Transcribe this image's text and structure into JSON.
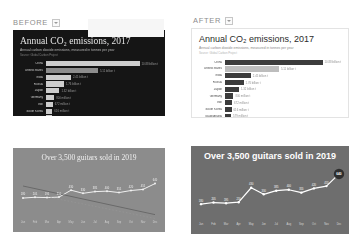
{
  "columns": {
    "before": {
      "label": "BEFORE",
      "caret": "chevron-down-icon"
    },
    "after": {
      "label": "AFTER",
      "caret": "chevron-down-icon"
    }
  },
  "co2_chart": {
    "title": "Annual CO₂ emissions, 2017",
    "subtitle": "Annual carbon dioxide emissions, measured in tonnes per year",
    "source": "Source: Global Carbon Project",
    "chart_data": {
      "type": "bar",
      "title": "Annual CO₂ emissions, 2017",
      "xlabel": "",
      "ylabel": "",
      "orientation": "horizontal",
      "categories": [
        "China",
        "United States",
        "India",
        "Russia",
        "Japan",
        "Germany",
        "Iran",
        "South Korea",
        "Saudi Arabia",
        "Indonesia"
      ],
      "values": [
        10.88,
        5.11,
        2.45,
        1.76,
        1.32,
        0.8,
        0.67,
        0.62,
        0.58,
        0.54
      ],
      "value_labels": [
        "10.88 billion t",
        "5.11 billion t",
        "2.45 billion t",
        "1.76 billion t",
        "1.32 billion t",
        "800 million t",
        "672 million t",
        "616 million t",
        "579 million t",
        "543 million t"
      ],
      "unit": "billion tonnes",
      "xlim": [
        0,
        11
      ],
      "grid": false,
      "legend": "none"
    }
  },
  "guitar_chart": {
    "title": "Over 3,500 guitars sold in 2019",
    "chart_data": {
      "type": "line",
      "title": "Over 3,500 guitars sold in 2019",
      "xlabel": "",
      "ylabel": "",
      "x": [
        "Jan",
        "Feb",
        "Mar",
        "Apr",
        "May",
        "Jun",
        "Jul",
        "Aug",
        "Sep",
        "Oct",
        "Nov",
        "Dec"
      ],
      "series": [
        {
          "name": "Guitars sold",
          "values": [
            180,
            205,
            195,
            210,
            430,
            330,
            385,
            400,
            355,
            420,
            455,
            640
          ]
        }
      ],
      "point_labels": [
        "180",
        "205",
        "195",
        "210",
        "430",
        "330",
        "385",
        "400",
        "355",
        "420",
        "455",
        "640"
      ],
      "end_marker_label": "640",
      "ylim": [
        0,
        700
      ],
      "grid": false,
      "legend": "none"
    }
  }
}
